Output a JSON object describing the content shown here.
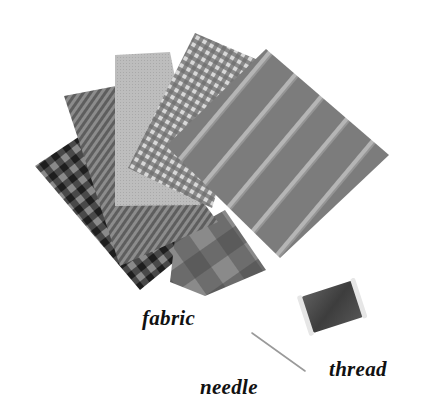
{
  "illustration": {
    "subject": "sewing materials",
    "items": [
      {
        "id": "fabric",
        "label": "fabric"
      },
      {
        "id": "needle",
        "label": "needle"
      },
      {
        "id": "thread",
        "label": "thread"
      }
    ],
    "swatches": [
      {
        "name": "dark-gingham",
        "pattern": "check"
      },
      {
        "name": "dark-plaid",
        "pattern": "plaid"
      },
      {
        "name": "pinstripe",
        "pattern": "stripes"
      },
      {
        "name": "plain-light",
        "pattern": "plain"
      },
      {
        "name": "small-gingham",
        "pattern": "check"
      },
      {
        "name": "wide-stripe",
        "pattern": "stripes"
      }
    ],
    "colors": {
      "background": "#ffffff",
      "label_text": "#111111",
      "spool": "#4a4a4a"
    }
  },
  "labels": {
    "fabric": "fabric",
    "needle": "needle",
    "thread": "thread"
  }
}
